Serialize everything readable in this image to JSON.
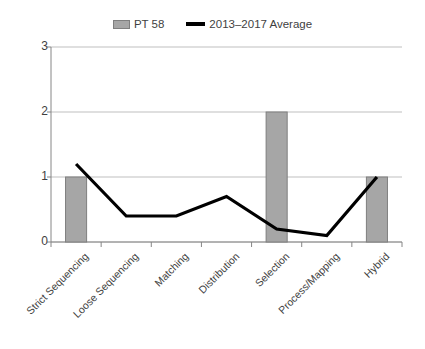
{
  "chart_data": {
    "type": "bar",
    "title": "",
    "subtitle": "",
    "xlabel": "",
    "ylabel": "",
    "ylim": [
      0,
      3
    ],
    "yticks": [
      "0",
      "1",
      "2",
      "3"
    ],
    "grid": true,
    "legend_position": "top-center",
    "categories": [
      "Strict Sequencing",
      "Loose Sequencing",
      "Matching",
      "Distribution",
      "Selection",
      "Process/Mapping",
      "Hybrid"
    ],
    "series": [
      {
        "name": "PT 58",
        "type": "bar",
        "color": "#a6a6a6",
        "border_color": "#7f7f7f",
        "values": [
          1,
          0,
          0,
          0,
          2,
          0,
          1
        ]
      },
      {
        "name": "2013–2017 Average",
        "type": "line",
        "color": "#000000",
        "values": [
          1.2,
          0.4,
          0.4,
          0.7,
          0.2,
          0.1,
          1.0
        ]
      }
    ]
  },
  "legend": {
    "items": [
      {
        "label": "PT 58",
        "marker": "bar-swatch-icon"
      },
      {
        "label": "2013–2017 Average",
        "marker": "line-swatch-icon"
      }
    ]
  }
}
